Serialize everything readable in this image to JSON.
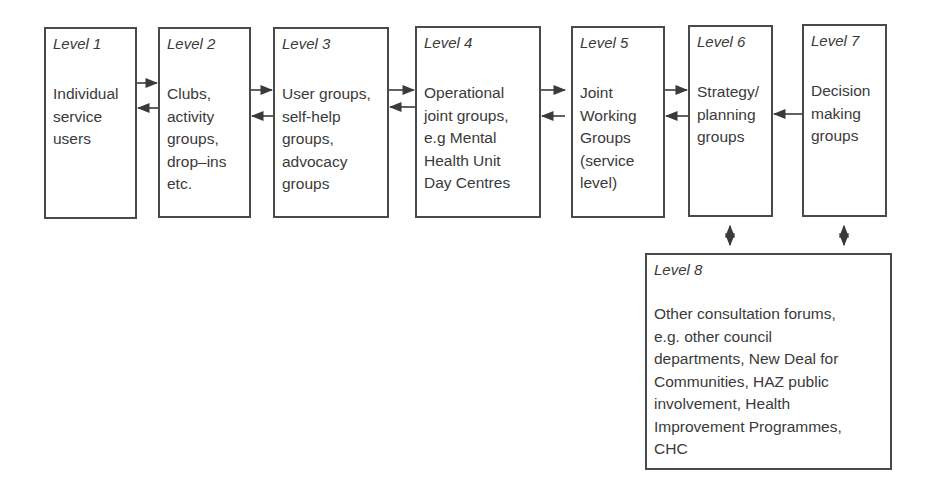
{
  "diagram": {
    "levels": [
      {
        "label": "Level 1",
        "text": "Individual\nservice\nusers"
      },
      {
        "label": "Level 2",
        "text": "Clubs,\nactivity\ngroups,\ndrop–ins\netc."
      },
      {
        "label": "Level 3",
        "text": "User groups,\nself-help\ngroups,\nadvocacy\ngroups"
      },
      {
        "label": "Level 4",
        "text": "Operational\njoint groups,\ne.g Mental\nHealth Unit\nDay Centres"
      },
      {
        "label": "Level 5",
        "text": "Joint\nWorking\nGroups\n(service\nlevel)"
      },
      {
        "label": "Level 6",
        "text": "Strategy/\nplanning\ngroups"
      },
      {
        "label": "Level 7",
        "text": "Decision\nmaking\ngroups"
      },
      {
        "label": "Level 8",
        "text": "Other consultation forums,\ne.g. other council\ndepartments, New Deal for\nCommunities, HAZ public\ninvolvement, Health\nImprovement Programmes,\nCHC"
      }
    ],
    "connections": [
      {
        "from": "Level 1",
        "to": "Level 2",
        "type": "bidirectional"
      },
      {
        "from": "Level 2",
        "to": "Level 3",
        "type": "bidirectional"
      },
      {
        "from": "Level 3",
        "to": "Level 4",
        "type": "bidirectional"
      },
      {
        "from": "Level 4",
        "to": "Level 5",
        "type": "bidirectional"
      },
      {
        "from": "Level 5",
        "to": "Level 6",
        "type": "bidirectional"
      },
      {
        "from": "Level 7",
        "to": "Level 6",
        "type": "one-way"
      },
      {
        "from": "Level 6",
        "to": "Level 8",
        "type": "bidirectional"
      },
      {
        "from": "Level 7",
        "to": "Level 8",
        "type": "bidirectional"
      }
    ],
    "colors": {
      "stroke": "#4a4a4a",
      "text": "#3a3a3a",
      "background": "#ffffff"
    }
  }
}
